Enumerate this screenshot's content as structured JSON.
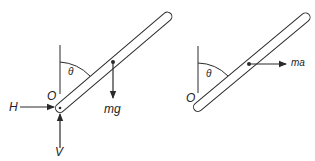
{
  "diagram": {
    "type": "free-body diagrams of a pivoted rod",
    "left_panel": {
      "pivot_label": "O",
      "angle_label": "θ",
      "forces": [
        {
          "label": "H",
          "direction": "right"
        },
        {
          "label": "V",
          "direction": "up"
        },
        {
          "label": "mg",
          "direction": "down"
        }
      ]
    },
    "right_panel": {
      "pivot_label": "O",
      "angle_label": "θ",
      "forces": [
        {
          "label": "ma",
          "direction": "right"
        }
      ]
    },
    "colors": {
      "stroke": "#2a2a2a",
      "fill": "#ffffff"
    }
  }
}
